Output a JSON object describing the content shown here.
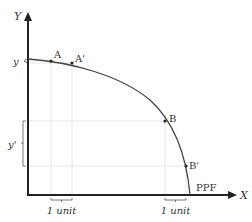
{
  "axes": {
    "y_label": "Y",
    "x_label": "X"
  },
  "points": {
    "A": "A",
    "A_prime": "A'",
    "B": "B",
    "B_prime": "B'"
  },
  "curve_label": "PPF",
  "y_tick_label": "y",
  "y_prime_label": "y'",
  "unit_labels": [
    "1 unit",
    "1 unit"
  ]
}
